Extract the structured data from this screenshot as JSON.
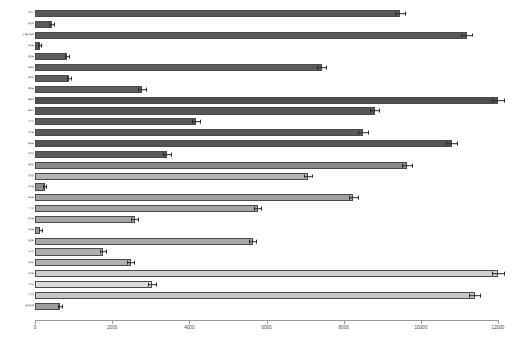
{
  "chart_data": {
    "type": "bar",
    "orientation": "horizontal",
    "title": "",
    "xlabel": "",
    "ylabel": "",
    "xlim": [
      0,
      12000
    ],
    "grid": false,
    "legend": false,
    "xticks": [
      0,
      2000,
      4000,
      6000,
      8000,
      10000,
      12000
    ],
    "xtick_labels": [
      "0",
      "2000",
      "4000",
      "6000",
      "8000",
      "10000",
      "12000"
    ],
    "has_error_bars": true,
    "categories": [
      "合计",
      "稻谷",
      "小麦玉米",
      "豆类",
      "薯类",
      "油料",
      "棉花",
      "麻类",
      "糖料",
      "烟叶",
      "茶叶",
      "水果",
      "蔬菜",
      "药材",
      "其他",
      "畜牧",
      "生猪",
      "家禽",
      "牛羊",
      "奶类",
      "蛋类",
      "渔业",
      "淡水",
      "海水",
      "林业",
      "木材",
      "竹材",
      "其他林"
    ],
    "values": [
      9460,
      430,
      11190,
      120,
      830,
      7430,
      880,
      2770,
      12000,
      8800,
      4180,
      8500,
      10800,
      3420,
      9650,
      7070,
      250,
      8250,
      5770,
      2580,
      140,
      5640,
      1760,
      2480,
      12000,
      3030,
      11400,
      640
    ],
    "errors": [
      130,
      55,
      140,
      30,
      60,
      110,
      60,
      95,
      150,
      120,
      100,
      120,
      140,
      95,
      130,
      110,
      45,
      115,
      100,
      90,
      30,
      100,
      70,
      85,
      150,
      95,
      145,
      50
    ],
    "bar_colors": [
      "#595959",
      "#5b5b5b",
      "#5a5a5a",
      "#5c5c5c",
      "#5d5d5d",
      "#5c5c5c",
      "#5e5e5e",
      "#5d5d5d",
      "#4f4f4f",
      "#565656",
      "#5a5a5a",
      "#585858",
      "#545454",
      "#5a5a5a",
      "#8a8a8a",
      "#b4b4b4",
      "#8d8d8d",
      "#a2a2a2",
      "#a4a4a4",
      "#a6a6a6",
      "#9b9b9b",
      "#a8a8a8",
      "#aeaeae",
      "#b0b0b0",
      "#cfcfcf",
      "#dcdcdc",
      "#c7c7c7",
      "#9e9e9e"
    ]
  },
  "extra_rows": {
    "values_tail": [
      1930,
      5320,
      1190,
      4860
    ],
    "errors_tail": [
      80,
      105,
      65,
      100
    ],
    "colors_tail": [
      "#8e8e8e",
      "#6b6b6b",
      "#6e6e6e",
      "#666666"
    ],
    "categories_tail": [
      "经济林",
      "花卉",
      "其他",
      "合计林"
    ]
  }
}
